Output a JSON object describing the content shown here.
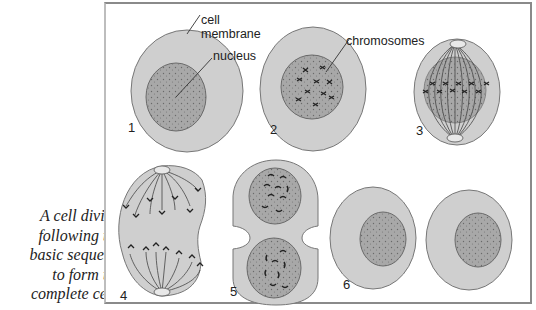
{
  "caption": {
    "lines": [
      "A cell divides",
      "following this",
      "basic sequence",
      "to form two",
      "complete cells."
    ]
  },
  "labels": {
    "cell_membrane_line1": "cell",
    "cell_membrane_line2": "membrane",
    "nucleus": "nucleus",
    "chromosomes": "chromosomes"
  },
  "stages": [
    {
      "number": "1",
      "description": "cell with nucleus"
    },
    {
      "number": "2",
      "description": "chromosomes visible in nucleus"
    },
    {
      "number": "3",
      "description": "spindle forms, chromosomes align"
    },
    {
      "number": "4",
      "description": "chromosomes pulled to poles"
    },
    {
      "number": "5",
      "description": "cell pinches, two nuclei"
    },
    {
      "number": "6",
      "description": "two complete cells"
    }
  ],
  "colors": {
    "cytoplasm": "#cfcfcf",
    "nucleus": "#a9a9a9",
    "outline": "#6f6f6f",
    "ink": "#222222"
  }
}
